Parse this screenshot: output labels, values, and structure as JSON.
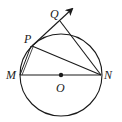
{
  "diagram": {
    "type": "geometry",
    "labels": {
      "Q": "Q",
      "P": "P",
      "M": "M",
      "O": "O",
      "N": "N"
    },
    "elements": [
      "circle centered at O",
      "diameter MN through O",
      "chord PN",
      "chord MP",
      "ray from P through Q (arrow)",
      "segment from N to ray PQ"
    ],
    "colors": {
      "stroke": "#1a1a1a",
      "background": "#ffffff"
    }
  }
}
